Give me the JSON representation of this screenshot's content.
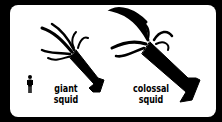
{
  "figure": {
    "items": [
      {
        "label_line1": "giant",
        "label_line2": "squid"
      },
      {
        "label_line1": "colossal",
        "label_line2": "squid"
      }
    ],
    "reference": "human-silhouette",
    "colors": {
      "background": "#000000",
      "panel": "#ffffff",
      "ink": "#000000"
    }
  }
}
